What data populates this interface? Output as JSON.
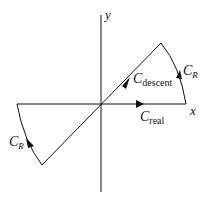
{
  "diagram": {
    "type": "contour-integration",
    "axes": {
      "x_label": "x",
      "y_label": "y"
    },
    "contours": [
      {
        "id": "real",
        "label": "C",
        "subscript": "real",
        "description": "along positive real axis, arrow pointing right"
      },
      {
        "id": "descent",
        "label": "C",
        "subscript": "descent",
        "description": "diagonal steepest-descent line through origin, arrow pointing up-right"
      },
      {
        "id": "arc_right",
        "label": "C",
        "subscript": "R",
        "description": "arc from x-axis to descent line, upper right"
      },
      {
        "id": "arc_left",
        "label": "C",
        "subscript": "R",
        "description": "arc from negative x-axis to descent line, lower left"
      }
    ],
    "colors": {
      "stroke": "#111111",
      "background": "#ffffff"
    }
  }
}
